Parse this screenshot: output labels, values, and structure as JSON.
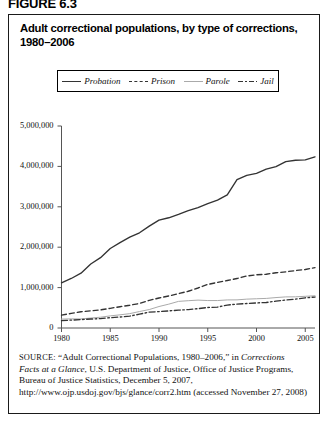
{
  "figure_label": "FIGURE 6.3",
  "title": {
    "line1": "Adult correctional populations, by type of corrections,",
    "line2": "1980–2006"
  },
  "legend": {
    "position": "top-inside",
    "items": [
      {
        "label": "Probation",
        "style": "solid",
        "color": "#333333"
      },
      {
        "label": "Prison",
        "style": "dashed",
        "color": "#333333"
      },
      {
        "label": "Parole",
        "style": "thin-solid",
        "color": "#aaaaaa"
      },
      {
        "label": "Jail",
        "style": "dash-dot",
        "color": "#333333"
      }
    ]
  },
  "source": {
    "prefix": "SOURCE:",
    "text_1": " “Adult Correctional Populations, 1980–2006,” in ",
    "italic_1": "Corrections Facts at a Glance",
    "text_2": ", U.S. Department of Justice, Office of Justice Programs, Bureau of Justice Statistics, December 5, 2007, http://www.ojp.usdoj.gov/bjs/glance/corr2.htm (accessed November 27, 2008)"
  },
  "chart_data": {
    "type": "line",
    "title": "Adult correctional populations, by type of corrections, 1980–2006",
    "xlabel": "",
    "ylabel": "",
    "xlim": [
      1980,
      2006
    ],
    "ylim": [
      0,
      5000000
    ],
    "grid": false,
    "legend_position": "top-inside",
    "xticks": [
      1980,
      1985,
      1990,
      1995,
      2000,
      2005
    ],
    "xticklabels": [
      "1980",
      "1985",
      "1990",
      "1995",
      "2000",
      "2005"
    ],
    "yticks": [
      0,
      1000000,
      2000000,
      3000000,
      4000000,
      5000000
    ],
    "yticklabels": [
      "0",
      "1,000,000",
      "2,000,000",
      "3,000,000",
      "4,000,000",
      "5,000,000"
    ],
    "x": [
      1980,
      1981,
      1982,
      1983,
      1984,
      1985,
      1986,
      1987,
      1988,
      1989,
      1990,
      1991,
      1992,
      1993,
      1994,
      1995,
      1996,
      1997,
      1998,
      1999,
      2000,
      2001,
      2002,
      2003,
      2004,
      2005,
      2006
    ],
    "series": [
      {
        "name": "Probation",
        "style": "solid",
        "color": "#333333",
        "values": [
          1118097,
          1225934,
          1357264,
          1582947,
          1740948,
          1968712,
          2114621,
          2247158,
          2356483,
          2522125,
          2670234,
          2728472,
          2811611,
          2903061,
          2981022,
          3077861,
          3164996,
          3296513,
          3670441,
          3779922,
          3826209,
          3931731,
          3995165,
          4120012,
          4151125,
          4162536,
          4237023
        ]
      },
      {
        "name": "Prison",
        "style": "dashed",
        "color": "#333333",
        "values": [
          319598,
          360029,
          402914,
          423898,
          448264,
          487593,
          526436,
          562814,
          607766,
          683367,
          743382,
          792535,
          850566,
          909381,
          990147,
          1078542,
          1127528,
          1176564,
          1224469,
          1287172,
          1316333,
          1330007,
          1367547,
          1390279,
          1421345,
          1448344,
          1492973
        ]
      },
      {
        "name": "Parole",
        "style": "thin-solid",
        "color": "#aaaaaa",
        "values": [
          220438,
          225539,
          224604,
          246440,
          266992,
          300203,
          325638,
          355505,
          407977,
          456803,
          531407,
          590442,
          658601,
          676100,
          690371,
          679421,
          679733,
          694787,
          696385,
          714457,
          723898,
          732333,
          753141,
          769925,
          771852,
          784408,
          798202
        ]
      },
      {
        "name": "Jail",
        "style": "dash-dot",
        "color": "#333333",
        "values": [
          182288,
          195085,
          207853,
          221815,
          233018,
          254986,
          272735,
          294092,
          341893,
          393303,
          405320,
          424129,
          441781,
          455500,
          479800,
          507044,
          518492,
          567079,
          592462,
          605943,
          621149,
          631240,
          665475,
          691301,
          713990,
          747529,
          766010
        ]
      }
    ]
  }
}
